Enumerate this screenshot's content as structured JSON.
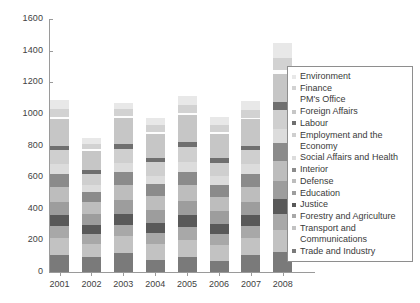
{
  "chart_data": {
    "type": "bar",
    "subtype": "stacked-vertical",
    "title": "",
    "xlabel": "",
    "ylabel": "",
    "categories": [
      "2001",
      "2002",
      "2003",
      "2004",
      "2005",
      "2006",
      "2007",
      "2008"
    ],
    "ylim": [
      0,
      1600
    ],
    "yticks": [
      0,
      200,
      400,
      600,
      800,
      1000,
      1200,
      1400,
      1600
    ],
    "ytick_labels": [
      "0",
      "200",
      "400",
      "600",
      "800",
      "1000",
      "1200",
      "1400",
      "1600"
    ],
    "grid": false,
    "legend_position": "right",
    "stack_order_bottom_to_top": [
      "Trade and Industry",
      "Transport and Communications",
      "Forestry and Agriculture",
      "Justice",
      "Education",
      "Defense",
      "Interior",
      "Social Affairs and Health",
      "Employment and the Economy",
      "Labour",
      "Foreign Affairs",
      "PM's Office",
      "Finance",
      "Environment"
    ],
    "series": [
      {
        "name": "Environment",
        "color": "#e8e8e8",
        "values": [
          55,
          40,
          40,
          45,
          55,
          50,
          55,
          95
        ]
      },
      {
        "name": "Finance",
        "color": "#d2d2d2",
        "values": [
          50,
          35,
          45,
          45,
          50,
          45,
          50,
          80
        ]
      },
      {
        "name": "PM's Office",
        "color": "#fdfdfd",
        "values": [
          12,
          10,
          12,
          10,
          12,
          10,
          12,
          20
        ]
      },
      {
        "name": "Foreign Affairs",
        "color": "#c6c6c6",
        "values": [
          170,
          120,
          165,
          150,
          175,
          155,
          165,
          180
        ]
      },
      {
        "name": "Labour",
        "color": "#6f6f6f",
        "values": [
          30,
          25,
          30,
          28,
          30,
          28,
          30,
          50
        ]
      },
      {
        "name": "Employment and the Economy",
        "color": "#cfcfcf",
        "values": [
          90,
          70,
          90,
          85,
          95,
          85,
          90,
          120
        ]
      },
      {
        "name": "Social Affairs and Health",
        "color": "#dcdcdc",
        "values": [
          60,
          45,
          60,
          55,
          60,
          55,
          60,
          90
        ]
      },
      {
        "name": "Interior",
        "color": "#8b8b8b",
        "values": [
          80,
          65,
          80,
          75,
          85,
          75,
          80,
          110
        ]
      },
      {
        "name": "Defense",
        "color": "#bdbdbd",
        "values": [
          95,
          75,
          95,
          90,
          100,
          90,
          95,
          130
        ]
      },
      {
        "name": "Education",
        "color": "#9d9d9d",
        "values": [
          85,
          70,
          85,
          80,
          90,
          80,
          85,
          115
        ]
      },
      {
        "name": "Justice",
        "color": "#595959",
        "values": [
          70,
          55,
          70,
          65,
          75,
          65,
          70,
          95
        ]
      },
      {
        "name": "Forestry and Agriculture",
        "color": "#a8a8a8",
        "values": [
          75,
          60,
          75,
          70,
          80,
          70,
          75,
          100
        ]
      },
      {
        "name": "Transport and Communications",
        "color": "#c2c2c2",
        "values": [
          105,
          85,
          105,
          100,
          110,
          100,
          105,
          140
        ]
      },
      {
        "name": "Trade and Industry",
        "color": "#7a7a7a",
        "values": [
          110,
          95,
          120,
          75,
          95,
          70,
          110,
          125
        ]
      }
    ],
    "totals": [
      1087,
      850,
      1072,
      973,
      1117,
      978,
      1082,
      1350
    ]
  },
  "legend": {
    "items": [
      {
        "label": "Environment",
        "color": "#e8e8e8"
      },
      {
        "label": "Finance",
        "color": "#d2d2d2"
      },
      {
        "label": "PM's Office",
        "color": "#fdfdfd"
      },
      {
        "label": "Foreign Affairs",
        "color": "#c6c6c6"
      },
      {
        "label": "Labour",
        "color": "#6f6f6f"
      },
      {
        "label": "Employment and the Economy",
        "color": "#cfcfcf"
      },
      {
        "label": "Social Affairs and Health",
        "color": "#dcdcdc"
      },
      {
        "label": "Interior",
        "color": "#8b8b8b"
      },
      {
        "label": "Defense",
        "color": "#bdbdbd"
      },
      {
        "label": "Education",
        "color": "#9d9d9d"
      },
      {
        "label": "Justice",
        "color": "#595959"
      },
      {
        "label": "Forestry and Agriculture",
        "color": "#a8a8a8"
      },
      {
        "label": "Transport and Communications",
        "color": "#c2c2c2"
      },
      {
        "label": "Trade and Industry",
        "color": "#7a7a7a"
      }
    ]
  },
  "axis_style": {
    "line_color": "#9a9a9a",
    "text_color": "#3f3f3f"
  }
}
